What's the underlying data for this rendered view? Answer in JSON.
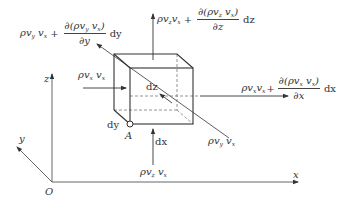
{
  "figure": {
    "type": "control-volume momentum flux diagram",
    "axes": {
      "origin_label": "O",
      "x_label": "x",
      "y_label": "y",
      "z_label": "z"
    },
    "point_label": "A",
    "dimensions": {
      "dx": "dx",
      "dy": "dy",
      "dz": "dz"
    },
    "fluxes": {
      "x_in": {
        "base": "ρv",
        "sub1": "x",
        "mid": " v",
        "sub2": "x"
      },
      "x_out": {
        "base": "ρv",
        "sub1": "x",
        "mid": "v",
        "sub2": "x",
        "plus": "+",
        "num": "∂(ρv",
        "num_sub1": "x",
        "num_mid": " v",
        "num_sub2": "x",
        "num_end": ")",
        "den": "∂x",
        "diff": "dx"
      },
      "y_in": {
        "base": "ρv",
        "sub1": "y",
        "mid": " v",
        "sub2": "x"
      },
      "y_out": {
        "base": "ρv",
        "sub1": "y",
        "mid": " v",
        "sub2": "x",
        "plus": "+",
        "num": "∂(ρv",
        "num_sub1": "y",
        "num_mid": " v",
        "num_sub2": "x",
        "num_end": ")",
        "den": "∂y",
        "diff": "dy"
      },
      "z_in": {
        "base": "ρv",
        "sub1": "z",
        "mid": " v",
        "sub2": "x"
      },
      "z_out": {
        "base": "ρv",
        "sub1": "z",
        "mid": "v",
        "sub2": "x",
        "plus": "+",
        "num": "∂(ρv",
        "num_sub1": "z",
        "num_mid": " v",
        "num_sub2": "x",
        "num_end": ")",
        "den": "∂z",
        "diff": "dz"
      }
    },
    "colors": {
      "line": "#333333",
      "axis": "#555555",
      "background": "#ffffff"
    }
  }
}
